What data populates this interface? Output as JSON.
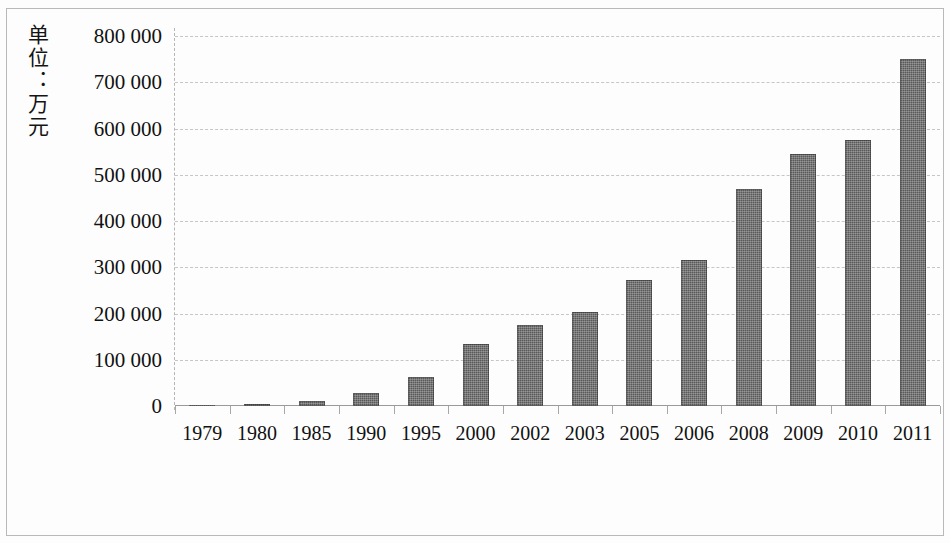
{
  "chart_data": {
    "type": "bar",
    "title": "",
    "subtitle": "",
    "xlabel": "",
    "ylabel": "单位：万元",
    "ylim": [
      0,
      800000
    ],
    "ytick_step": 100000,
    "ytick_labels": [
      "800 000",
      "700 000",
      "600 000",
      "500 000",
      "400 000",
      "300 000",
      "200 000",
      "100 000",
      "0"
    ],
    "ytick_values": [
      800000,
      700000,
      600000,
      500000,
      400000,
      300000,
      200000,
      100000,
      0
    ],
    "grid": true,
    "grid_style": "horizontal dashed",
    "legend": "none",
    "bar_color": "#595959",
    "categories": [
      "1979",
      "1980",
      "1985",
      "1990",
      "1995",
      "2000",
      "2002",
      "2003",
      "2005",
      "2006",
      "2008",
      "2009",
      "2010",
      "2011"
    ],
    "values": [
      2000,
      4000,
      10000,
      28000,
      63000,
      135000,
      175000,
      203000,
      272000,
      315000,
      470000,
      545000,
      575000,
      750000
    ],
    "series": [
      {
        "name": "金额",
        "values": [
          2000,
          4000,
          10000,
          28000,
          63000,
          135000,
          175000,
          203000,
          272000,
          315000,
          470000,
          545000,
          575000,
          750000
        ]
      }
    ]
  }
}
